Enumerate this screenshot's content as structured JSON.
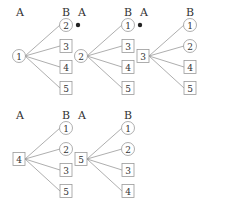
{
  "column_labels": {
    "left": "A",
    "right": "B"
  },
  "trees": [
    {
      "root": {
        "value": "1",
        "shape": "circle"
      },
      "children": [
        {
          "value": "2",
          "shape": "circle",
          "marked": true
        },
        {
          "value": "3",
          "shape": "square",
          "marked": false
        },
        {
          "value": "4",
          "shape": "square",
          "marked": false
        },
        {
          "value": "5",
          "shape": "square",
          "marked": false
        }
      ]
    },
    {
      "root": {
        "value": "2",
        "shape": "circle"
      },
      "children": [
        {
          "value": "1",
          "shape": "circle",
          "marked": true
        },
        {
          "value": "3",
          "shape": "square",
          "marked": false
        },
        {
          "value": "4",
          "shape": "square",
          "marked": false
        },
        {
          "value": "5",
          "shape": "square",
          "marked": false
        }
      ]
    },
    {
      "root": {
        "value": "3",
        "shape": "square"
      },
      "children": [
        {
          "value": "1",
          "shape": "circle",
          "marked": false
        },
        {
          "value": "2",
          "shape": "circle",
          "marked": false
        },
        {
          "value": "4",
          "shape": "square",
          "marked": false
        },
        {
          "value": "5",
          "shape": "square",
          "marked": false
        }
      ]
    },
    {
      "root": {
        "value": "4",
        "shape": "square"
      },
      "children": [
        {
          "value": "1",
          "shape": "circle",
          "marked": false
        },
        {
          "value": "2",
          "shape": "circle",
          "marked": false
        },
        {
          "value": "3",
          "shape": "square",
          "marked": false
        },
        {
          "value": "5",
          "shape": "square",
          "marked": false
        }
      ]
    },
    {
      "root": {
        "value": "5",
        "shape": "square"
      },
      "children": [
        {
          "value": "1",
          "shape": "circle",
          "marked": false
        },
        {
          "value": "2",
          "shape": "circle",
          "marked": false
        },
        {
          "value": "3",
          "shape": "square",
          "marked": false
        },
        {
          "value": "4",
          "shape": "square",
          "marked": false
        }
      ]
    }
  ],
  "colors": {
    "line": "#999999",
    "text": "#333333",
    "marker": "#222222"
  }
}
